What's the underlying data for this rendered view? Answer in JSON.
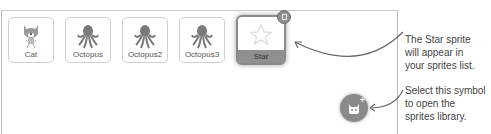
{
  "sprites_pane": {
    "sprites": [
      {
        "name": "Cat",
        "icon": "cat-icon",
        "selected": false
      },
      {
        "name": "Octopus",
        "icon": "octopus-icon",
        "selected": false
      },
      {
        "name": "Octopus2",
        "icon": "octopus-icon",
        "selected": false
      },
      {
        "name": "Octopus3",
        "icon": "octopus-icon",
        "selected": false
      },
      {
        "name": "Star",
        "icon": "star-icon",
        "selected": true
      }
    ],
    "delete_icon": "trash-icon",
    "choose_sprite_button": {
      "icon": "cat-plus-icon",
      "plus": "+"
    }
  },
  "annotations": {
    "star_note": [
      "The Star sprite",
      "will appear in",
      "your sprites list."
    ],
    "library_note": [
      "Select this symbol",
      "to open the",
      "sprites library."
    ]
  },
  "colors": {
    "tile_border": "#cfcfcf",
    "selected_gray": "#8f8f8f",
    "icon_gray": "#7a7a7a",
    "text": "#444444"
  }
}
